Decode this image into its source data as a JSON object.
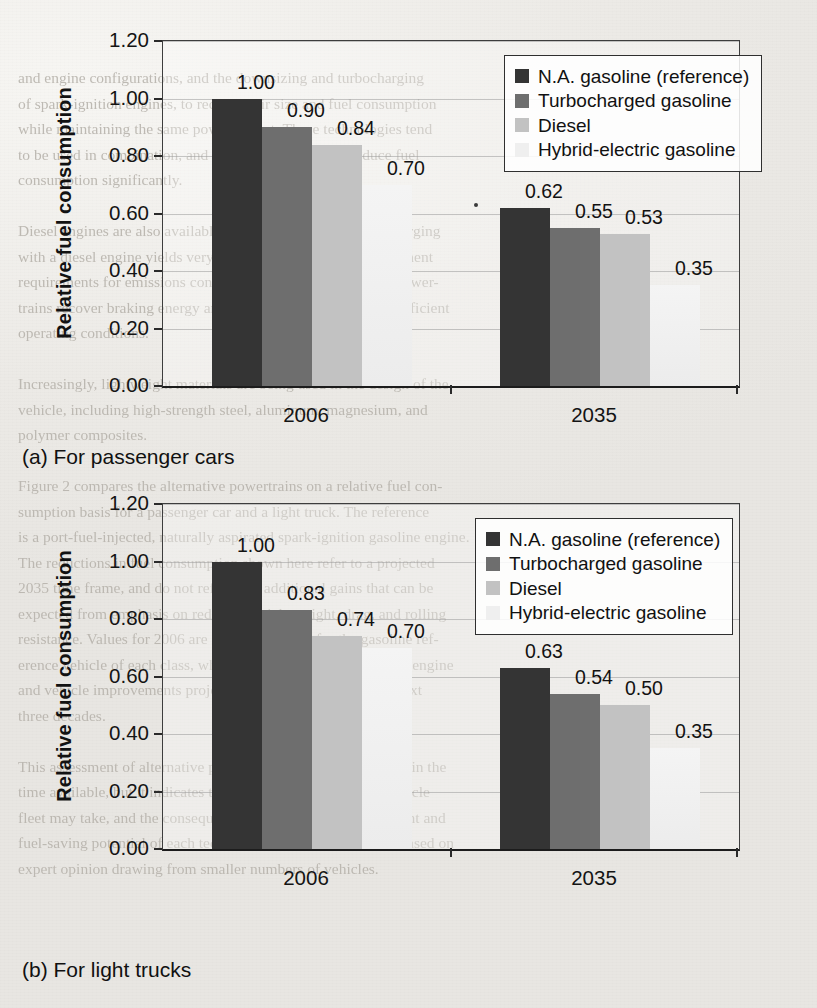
{
  "page": {
    "background_color": "#efeeea",
    "bleed_text_color": "#b9b5ae",
    "bleed_text": "and engine configurations, and the downsizing and turbocharging\nof spark-ignition engines, to reduce their size and fuel consumption\nwhile maintaining the same power output. These technologies tend\nto be used in combination, and all can be expected to reduce fuel\nconsumption significantly.\n\nDiesel engines are also available. The combination of turbocharging\nwith a diesel engine yields very high efficiency, but after-treatment\nrequirements for emissions control add cost. Hybrid-electric power-\ntrains recover braking energy and operate the engine at more efficient\noperating conditions.\n\nIncreasingly, lightweight materials are being used in the design of the\nvehicle, including high-strength steel, aluminum, magnesium, and\npolymer composites.\n\nFigure 2 compares the alternative powertrains on a relative fuel con-\nsumption basis for a passenger car and a light truck. The reference\nis a port-fuel-injected, naturally aspirated spark-ignition gasoline engine.\nThe reductions in fuel consumption shown here refer to a projected\n2035 time frame, and do not reflect the additional gains that can be\nexpected from emphasis on reduced vehicle weight, drag, and rolling\nresistance. Values for 2006 are indexed to unity for the gasoline ref-\nerence vehicle of each class, while the 2035 values reflect both engine\nand vehicle improvements projected to be available over the next\nthree decades.\n\nThis assessment of alternative powertrains is not complete within the\ntime available, but it indicates the broad directions that the vehicle\nfleet may take, and the consequent changes in the vehicle weight and\nfuel-saving potential of each technology. These estimates are based on\nexpert opinion drawing from smaller numbers of vehicles."
  },
  "figure": {
    "panels": [
      {
        "caption": "(a) For passenger cars"
      },
      {
        "caption": "(b) For light trucks"
      }
    ],
    "series_colors": [
      "#343434",
      "#6e6e6e",
      "#c2c2c2",
      "#efefef"
    ]
  },
  "chart_data": [
    {
      "type": "bar",
      "title": "(a) For passenger cars",
      "xlabel": "",
      "ylabel": "Relative fuel consumption",
      "categories": [
        "2006",
        "2035"
      ],
      "ylim": [
        0.0,
        1.2
      ],
      "yticks": [
        "0.00",
        "0.20",
        "0.40",
        "0.60",
        "0.80",
        "1.00",
        "1.20"
      ],
      "ytick_values": [
        0.0,
        0.2,
        0.4,
        0.6,
        0.8,
        1.0,
        1.2
      ],
      "grid": true,
      "legend_position": "upper right",
      "series": [
        {
          "name": "N.A. gasoline (reference)",
          "color": "#343434",
          "values": [
            1.0,
            0.62
          ],
          "labels": [
            "1.00",
            "0.62"
          ]
        },
        {
          "name": "Turbocharged gasoline",
          "color": "#6e6e6e",
          "values": [
            0.9,
            0.55
          ],
          "labels": [
            "0.90",
            "0.55"
          ]
        },
        {
          "name": "Diesel",
          "color": "#c2c2c2",
          "values": [
            0.84,
            0.53
          ],
          "labels": [
            "0.84",
            "0.53"
          ]
        },
        {
          "name": "Hybrid-electric gasoline",
          "color": "#efefef",
          "values": [
            0.7,
            0.35
          ],
          "labels": [
            "0.70",
            "0.35"
          ]
        }
      ]
    },
    {
      "type": "bar",
      "title": "(b) For light trucks",
      "xlabel": "",
      "ylabel": "Relative fuel consumption",
      "categories": [
        "2006",
        "2035"
      ],
      "ylim": [
        0.0,
        1.2
      ],
      "yticks": [
        "0.00",
        "0.20",
        "0.40",
        "0.60",
        "0.80",
        "1.00",
        "1.20"
      ],
      "ytick_values": [
        0.0,
        0.2,
        0.4,
        0.6,
        0.8,
        1.0,
        1.2
      ],
      "grid": true,
      "legend_position": "upper right",
      "series": [
        {
          "name": "N.A. gasoline (reference)",
          "color": "#343434",
          "values": [
            1.0,
            0.63
          ],
          "labels": [
            "1.00",
            "0.63"
          ]
        },
        {
          "name": "Turbocharged gasoline",
          "color": "#6e6e6e",
          "values": [
            0.83,
            0.54
          ],
          "labels": [
            "0.83",
            "0.54"
          ]
        },
        {
          "name": "Diesel",
          "color": "#c2c2c2",
          "values": [
            0.74,
            0.5
          ],
          "labels": [
            "0.74",
            "0.50"
          ]
        },
        {
          "name": "Hybrid-electric gasoline",
          "color": "#efefef",
          "values": [
            0.7,
            0.35
          ],
          "labels": [
            "0.70",
            "0.35"
          ]
        }
      ]
    }
  ]
}
